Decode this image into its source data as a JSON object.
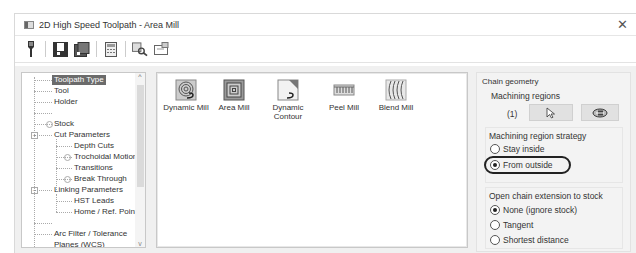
{
  "window": {
    "title": "2D High Speed Toolpath - Area Mill",
    "close_icon": "close-icon"
  },
  "toolbar": {
    "icons": [
      "tool-icon",
      "save-icon",
      "save-as-icon",
      "calculator-icon",
      "preview-icon",
      "export-icon"
    ]
  },
  "tree": {
    "items": [
      {
        "label": "Toolpath Type",
        "selected": true
      },
      {
        "label": "Tool"
      },
      {
        "label": "Holder"
      },
      {
        "label": ""
      },
      {
        "label": "Stock"
      },
      {
        "label": "Cut Parameters"
      },
      {
        "label": "Depth Cuts"
      },
      {
        "label": "Trochoidal Motion"
      },
      {
        "label": "Transitions"
      },
      {
        "label": "Break Through"
      },
      {
        "label": "Linking Parameters"
      },
      {
        "label": "HST Leads"
      },
      {
        "label": "Home / Ref. Points"
      },
      {
        "label": ""
      },
      {
        "label": "Arc Filter / Tolerance"
      },
      {
        "label": "Planes (WCS)"
      }
    ]
  },
  "toolpath_types": [
    {
      "label": "Dynamic Mill"
    },
    {
      "label": "Area Mill"
    },
    {
      "label": "Dynamic Contour"
    },
    {
      "label": "Peel Mill"
    },
    {
      "label": "Blend Mill"
    }
  ],
  "chain_geometry": {
    "title": "Chain geometry",
    "machining_regions_label": "Machining regions",
    "count": "(1)",
    "strategy_title": "Machining region strategy",
    "strategy_options": [
      {
        "label": "Stay inside",
        "checked": false
      },
      {
        "label": "From outside",
        "checked": true
      }
    ],
    "open_chain_title": "Open chain extension to stock",
    "open_chain_options": [
      {
        "label": "None (ignore stock)",
        "checked": true
      },
      {
        "label": "Tangent",
        "checked": false
      },
      {
        "label": "Shortest distance",
        "checked": false
      }
    ]
  }
}
